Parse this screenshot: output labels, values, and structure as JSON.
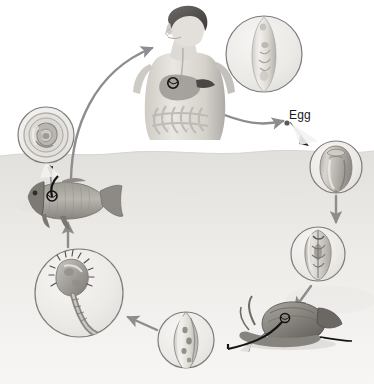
{
  "diagram": {
    "background_color": "#ffffff",
    "ground_color": "#e6e4e0",
    "arrow_color": "#8d8d8d",
    "circle_stroke": "#7c7c7c",
    "circle_fill": "#efeeec",
    "label_color": "#1a1a1a"
  },
  "labels": [
    {
      "id": "egg",
      "text": "Egg",
      "x": 289,
      "y": 112
    }
  ],
  "stages": [
    {
      "id": "definitive-host-human",
      "name": "human-host",
      "label": "",
      "x": 185,
      "y": 62,
      "marker": {
        "visible": true,
        "x": 173,
        "y": 82
      }
    },
    {
      "id": "adult-fluke",
      "name": "adult-fluke-inset",
      "label": "",
      "cx": 264,
      "cy": 54,
      "r": 39
    },
    {
      "id": "egg-inset",
      "name": "egg-inset",
      "label": "",
      "cx": 336,
      "cy": 167,
      "r": 27
    },
    {
      "id": "miracidium-redia",
      "name": "redia-inset",
      "label": "",
      "cx": 318,
      "cy": 254,
      "r": 28
    },
    {
      "id": "snail-host",
      "name": "snail-host",
      "label": "",
      "x": 283,
      "y": 317,
      "marker": {
        "visible": true,
        "x": 285,
        "y": 318
      }
    },
    {
      "id": "sporocyst",
      "name": "sporocyst-inset",
      "label": "",
      "cx": 186,
      "cy": 340,
      "r": 29
    },
    {
      "id": "cercaria",
      "name": "cercaria-inset",
      "label": "",
      "cx": 79,
      "cy": 293,
      "r": 45
    },
    {
      "id": "fish-host",
      "name": "fish-host",
      "label": "",
      "x": 60,
      "y": 196,
      "marker": {
        "visible": true,
        "x": 52,
        "y": 196
      }
    },
    {
      "id": "metacercaria",
      "name": "metacercaria-inset",
      "label": "",
      "cx": 46,
      "cy": 135,
      "r": 29
    }
  ],
  "arrows": [
    {
      "id": "fish-to-human",
      "name": "arrow-fish-to-human",
      "from": "fish-host",
      "to": "human-host",
      "style": "curved"
    },
    {
      "id": "human-to-egg",
      "name": "arrow-human-to-egg",
      "from": "human-host",
      "to": "egg",
      "style": "curved"
    },
    {
      "id": "egg-to-snail",
      "name": "arrow-egg-to-snail",
      "from": "egg-inset",
      "to": "snail-host",
      "style": "straight"
    },
    {
      "id": "redia-to-snail",
      "name": "arrow-redia-to-snail",
      "from": "redia-inset",
      "to": "snail-host",
      "style": "straight"
    },
    {
      "id": "sporocyst-to-cercaria",
      "name": "arrow-sporocyst-to-cercaria",
      "from": "sporocyst-inset",
      "to": "cercaria-inset",
      "style": "straight"
    },
    {
      "id": "cercaria-to-fish",
      "name": "arrow-cercaria-to-fish",
      "from": "cercaria-inset",
      "to": "fish-host",
      "style": "straight"
    },
    {
      "id": "fish-to-metacercaria",
      "name": "arrow-fish-to-metacercaria",
      "from": "fish-host",
      "to": "metacercaria-inset",
      "style": "straight"
    }
  ],
  "leaders": [
    {
      "id": "adult-leader",
      "name": "leader-adult-fluke",
      "from": "human-host",
      "to": "adult-fluke-inset"
    },
    {
      "id": "egg-leader",
      "name": "leader-egg",
      "from": "egg",
      "to": "egg-inset"
    },
    {
      "id": "snail-leader",
      "name": "leader-snail",
      "from": "snail-host",
      "to": "sporocyst-inset"
    },
    {
      "id": "fish-leader",
      "name": "leader-fish",
      "from": "fish-host",
      "to": "metacercaria-inset"
    }
  ]
}
